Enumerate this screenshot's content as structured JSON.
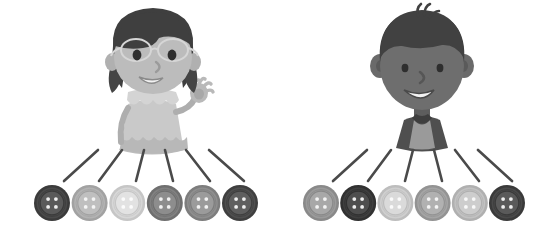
{
  "illustration": {
    "title": "Two children each with a row of six buttons",
    "background_color": "#ffffff",
    "width": 538,
    "height": 244,
    "palette": {
      "outline": "#3a3a3a",
      "line_stroke": "#4a4a4a",
      "skin_light": "#b9b9b9",
      "skin_light_shadow": "#a4a4a4",
      "skin_dark": "#6e6e6e",
      "skin_dark_shadow": "#5d5d5d",
      "hair_dark": "#454545",
      "hair_darkest": "#3c3c3c",
      "dress_light": "#c9c9c9",
      "dress_shadow": "#b5b5b5",
      "shirt_dark": "#4f4f4f",
      "shirt_light": "#9a9a9a",
      "glasses": "#d8d8d8",
      "mouth_white": "#f2f2f2",
      "eye_black": "#2e2e2e"
    }
  },
  "characters": [
    {
      "id": "girl",
      "name": "girl-with-glasses",
      "label": "Girl with glasses waving",
      "side": "left",
      "center_x": 152,
      "features": {
        "hair": "long dark hair with side strands",
        "accessory": "eyeglasses",
        "expression": "smiling",
        "gesture": "right hand raised waving",
        "clothing": "light gray dress with scalloped collar and hem"
      }
    },
    {
      "id": "boy",
      "name": "boy-with-spiky-hair",
      "label": "Boy with spiky hair",
      "side": "right",
      "center_x": 421,
      "features": {
        "hair": "dark spiky hair with tuft on top",
        "accessory": "none",
        "expression": "smiling with open mouth",
        "gesture": "none",
        "clothing": "dark collared shirt with light gray chest panel"
      }
    }
  ],
  "groups": [
    {
      "id": "left-group",
      "name": "left-button-group",
      "owner": "girl",
      "count": 6,
      "row_y": 203,
      "button_radius": 18,
      "first_center_x": 52,
      "spacing_x": 37.6,
      "buttons": [
        {
          "index": 1,
          "shade": "#4a4a4a",
          "rim": "#3b3b3b",
          "inner": "#5a5a5a",
          "hole": "#efefef",
          "tone": "dark"
        },
        {
          "index": 2,
          "shade": "#b3b3b3",
          "rim": "#a2a2a2",
          "inner": "#bfbfbf",
          "hole": "#f4f4f4",
          "tone": "light"
        },
        {
          "index": 3,
          "shade": "#d7d7d7",
          "rim": "#c6c6c6",
          "inner": "#e2e2e2",
          "hole": "#fbfbfb",
          "tone": "very-light"
        },
        {
          "index": 4,
          "shade": "#818181",
          "rim": "#6f6f6f",
          "inner": "#8d8d8d",
          "hole": "#f1f1f1",
          "tone": "medium-dark"
        },
        {
          "index": 5,
          "shade": "#8f8f8f",
          "rim": "#7d7d7d",
          "inner": "#9b9b9b",
          "hole": "#f2f2f2",
          "tone": "medium"
        },
        {
          "index": 6,
          "shade": "#4f4f4f",
          "rim": "#3f3f3f",
          "inner": "#5f5f5f",
          "hole": "#efefef",
          "tone": "dark"
        }
      ],
      "connectors": [
        {
          "index": 1,
          "x1": 98,
          "y1": 150,
          "x2": 64,
          "y2": 181
        },
        {
          "index": 2,
          "x1": 122,
          "y1": 150,
          "x2": 99,
          "y2": 181
        },
        {
          "index": 3,
          "x1": 144,
          "y1": 150,
          "x2": 136,
          "y2": 181
        },
        {
          "index": 4,
          "x1": 165,
          "y1": 150,
          "x2": 173,
          "y2": 181
        },
        {
          "index": 5,
          "x1": 186,
          "y1": 150,
          "x2": 210,
          "y2": 181
        },
        {
          "index": 6,
          "x1": 209,
          "y1": 150,
          "x2": 244,
          "y2": 181
        }
      ]
    },
    {
      "id": "right-group",
      "name": "right-button-group",
      "owner": "boy",
      "count": 6,
      "row_y": 203,
      "button_radius": 18,
      "first_center_x": 321,
      "spacing_x": 37.2,
      "buttons": [
        {
          "index": 1,
          "shade": "#9b9b9b",
          "rim": "#898989",
          "inner": "#a8a8a8",
          "hole": "#f3f3f3",
          "tone": "medium"
        },
        {
          "index": 2,
          "shade": "#3f3f3f",
          "rim": "#313131",
          "inner": "#4e4e4e",
          "hole": "#eeeeee",
          "tone": "very-dark"
        },
        {
          "index": 3,
          "shade": "#cfcfcf",
          "rim": "#bdbdbd",
          "inner": "#dadada",
          "hole": "#fafafa",
          "tone": "very-light"
        },
        {
          "index": 4,
          "shade": "#a5a5a5",
          "rim": "#939393",
          "inner": "#b1b1b1",
          "hole": "#f4f4f4",
          "tone": "medium-light"
        },
        {
          "index": 5,
          "shade": "#c2c2c2",
          "rim": "#b0b0b0",
          "inner": "#cdcdcd",
          "hole": "#f8f8f8",
          "tone": "light"
        },
        {
          "index": 6,
          "shade": "#4a4a4a",
          "rim": "#3a3a3a",
          "inner": "#5a5a5a",
          "hole": "#efefef",
          "tone": "dark"
        }
      ],
      "connectors": [
        {
          "index": 1,
          "x1": 367,
          "y1": 150,
          "x2": 333,
          "y2": 181
        },
        {
          "index": 2,
          "x1": 391,
          "y1": 150,
          "x2": 368,
          "y2": 181
        },
        {
          "index": 3,
          "x1": 413,
          "y1": 150,
          "x2": 405,
          "y2": 181
        },
        {
          "index": 4,
          "x1": 434,
          "y1": 150,
          "x2": 442,
          "y2": 181
        },
        {
          "index": 5,
          "x1": 455,
          "y1": 150,
          "x2": 479,
          "y2": 181
        },
        {
          "index": 6,
          "x1": 478,
          "y1": 150,
          "x2": 512,
          "y2": 181
        }
      ]
    }
  ]
}
